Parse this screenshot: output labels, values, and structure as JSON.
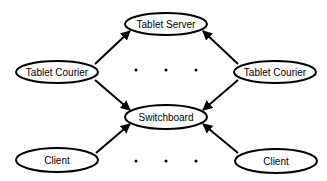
{
  "diagram": {
    "nodes": [
      {
        "id": "tablet_server",
        "label": "Tablet Server",
        "cx": 166,
        "cy": 24,
        "rx": 41,
        "ry": 11
      },
      {
        "id": "tablet_courier_left",
        "label": "Tablet Courier",
        "cx": 57,
        "cy": 72,
        "rx": 41,
        "ry": 11
      },
      {
        "id": "tablet_courier_right",
        "label": "Tablet Courier",
        "cx": 275,
        "cy": 72,
        "rx": 41,
        "ry": 11
      },
      {
        "id": "switchboard",
        "label": "Switchboard",
        "cx": 166,
        "cy": 117,
        "rx": 41,
        "ry": 12
      },
      {
        "id": "client_left",
        "label": "Client",
        "cx": 57,
        "cy": 160,
        "rx": 41,
        "ry": 12
      },
      {
        "id": "client_right",
        "label": "Client",
        "cx": 276,
        "cy": 161,
        "rx": 41,
        "ry": 12
      }
    ],
    "edges": [
      {
        "from": "tablet_courier_left",
        "to": "tablet_server"
      },
      {
        "from": "tablet_courier_right",
        "to": "tablet_server"
      },
      {
        "from": "tablet_courier_left",
        "to": "switchboard"
      },
      {
        "from": "tablet_courier_right",
        "to": "switchboard"
      },
      {
        "from": "client_left",
        "to": "switchboard"
      },
      {
        "from": "client_right",
        "to": "switchboard"
      }
    ],
    "ellipsis_rows": [
      {
        "between": [
          "tablet_courier_left",
          "tablet_courier_right"
        ],
        "y": 70,
        "xs": [
          136,
          166,
          196
        ]
      },
      {
        "between": [
          "client_left",
          "client_right"
        ],
        "y": 161,
        "xs": [
          136,
          166,
          196
        ]
      }
    ]
  }
}
